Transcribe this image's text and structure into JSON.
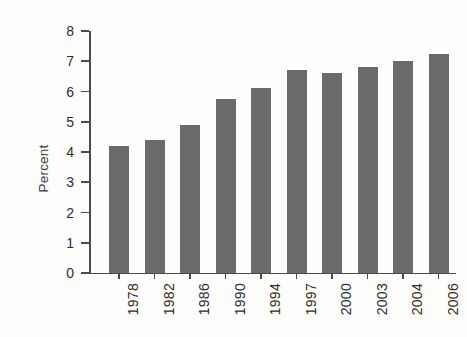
{
  "chart_data": {
    "type": "bar",
    "title": "",
    "subtitle": "",
    "xlabel": "",
    "ylabel": "Percent",
    "categories": [
      "1978",
      "1982",
      "1986",
      "1990",
      "1994",
      "1997",
      "2000",
      "2003",
      "2004",
      "2006"
    ],
    "values": [
      4.2,
      4.4,
      4.9,
      5.75,
      6.1,
      6.7,
      6.6,
      6.8,
      7.0,
      7.25
    ],
    "ylim": [
      0,
      8
    ],
    "y_ticks": [
      "0",
      "1",
      "2",
      "3",
      "4",
      "5",
      "6",
      "7",
      "8"
    ],
    "grid": false,
    "legend": "none",
    "bar_color": "#6b6b6b",
    "axis_color": "#4a4a4a",
    "background_color": "#fdfdfc",
    "text_color": "#2e2e2e"
  }
}
